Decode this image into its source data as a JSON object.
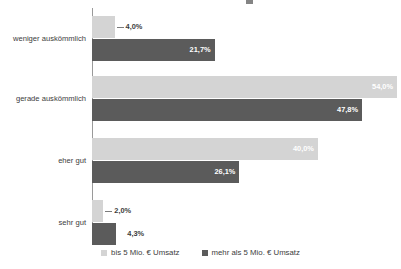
{
  "chart_data": {
    "type": "bar",
    "orientation": "horizontal",
    "title": "",
    "xlabel": "",
    "ylabel": "",
    "categories": [
      "weniger auskömmlich",
      "gerade auskömmlich",
      "eher gut",
      "sehr gut"
    ],
    "series": [
      {
        "name": "bis 5 Mio. € Umsatz",
        "color": "#d4d4d4",
        "values": [
          4.0,
          54.0,
          40.0,
          2.0
        ],
        "labels": [
          "4,0%",
          "54,0%",
          "40,0%",
          "2,0%"
        ]
      },
      {
        "name": "mehr als 5 Mio. € Umsatz",
        "color": "#5b5b5b",
        "values": [
          21.7,
          47.8,
          26.1,
          4.3
        ],
        "labels": [
          "21,7%",
          "47,8%",
          "26,1%",
          "4,3%"
        ]
      }
    ],
    "xlim": [
      0,
      54.7
    ],
    "grid": false,
    "legend_position": "bottom"
  },
  "legend": {
    "items": [
      {
        "label": "bis 5 Mio. € Umsatz",
        "color": "#d4d4d4"
      },
      {
        "label": "mehr als 5 Mio. € Umsatz",
        "color": "#5b5b5b"
      }
    ]
  }
}
